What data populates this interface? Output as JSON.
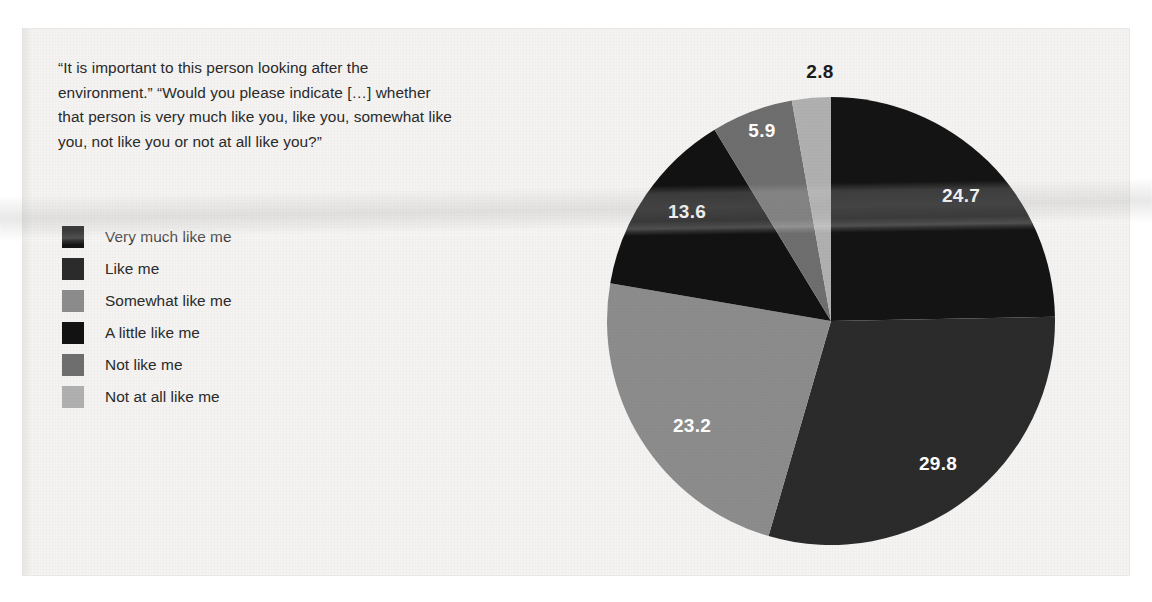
{
  "question": "“It is important to this person looking after the environment.” “Would you please indicate […] whether that person is very much like you, like you, somewhat like you, not like you or not at all like you?”",
  "legend": {
    "items": [
      {
        "label": "Very much like me",
        "color": "#141414"
      },
      {
        "label": "Like me",
        "color": "#2b2b2b"
      },
      {
        "label": "Somewhat like me",
        "color": "#8c8c8c"
      },
      {
        "label": "A little like me",
        "color": "#121212"
      },
      {
        "label": "Not like me",
        "color": "#6e6e6e"
      },
      {
        "label": "Not at all like me",
        "color": "#b0b0b0"
      }
    ]
  },
  "chart_data": {
    "type": "pie",
    "title": "",
    "xlabel": "",
    "ylabel": "",
    "legend_position": "left",
    "grid": false,
    "start_angle_deg": 0,
    "direction": "clockwise",
    "units": "percent",
    "categories": [
      "Very much like me",
      "Like me",
      "Somewhat like me",
      "A little like me",
      "Not like me",
      "Not at all like me"
    ],
    "values": [
      24.7,
      29.8,
      23.2,
      13.6,
      5.9,
      2.8
    ],
    "colors": [
      "#141414",
      "#2b2b2b",
      "#8c8c8c",
      "#121212",
      "#6e6e6e",
      "#b0b0b0"
    ],
    "data_labels": [
      "24.7",
      "29.8",
      "23.2",
      "13.6",
      "5.9",
      "2.8"
    ],
    "data_label_colors": [
      "#ffffff",
      "#ffffff",
      "#ffffff",
      "#ffffff",
      "#ffffff",
      "#1b1b1b"
    ],
    "data_label_positions": [
      {
        "x": 961,
        "y": 196,
        "inside": true
      },
      {
        "x": 938,
        "y": 464,
        "inside": true
      },
      {
        "x": 692,
        "y": 426,
        "inside": true
      },
      {
        "x": 687,
        "y": 212,
        "inside": true
      },
      {
        "x": 762,
        "y": 131,
        "inside": true
      },
      {
        "x": 820,
        "y": 72,
        "inside": false
      }
    ],
    "geometry": {
      "cx": 831,
      "cy": 321,
      "r": 224
    }
  }
}
